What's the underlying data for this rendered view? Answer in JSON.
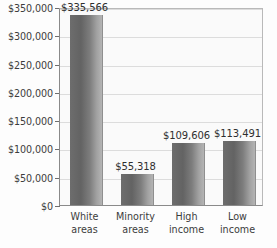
{
  "chart_data": {
    "type": "bar",
    "title": "",
    "subtitle": "",
    "xlabel": "",
    "ylabel": "",
    "categories": [
      "White areas",
      "Minority areas",
      "High income",
      "Low income"
    ],
    "category_lines": [
      [
        "White",
        "areas"
      ],
      [
        "Minority",
        "areas"
      ],
      [
        "High",
        "income"
      ],
      [
        "Low",
        "income"
      ]
    ],
    "values": [
      335566,
      55318,
      109606,
      113491
    ],
    "data_labels": [
      "$335,566",
      "$55,318",
      "$109,606",
      "$113,491"
    ],
    "ylim": [
      0,
      350000
    ],
    "ytick_values": [
      0,
      50000,
      100000,
      150000,
      200000,
      250000,
      300000,
      350000
    ],
    "ytick_labels": [
      "$0",
      "$50,000",
      "$100,000",
      "$150,000",
      "$200,000",
      "$250,000",
      "$300,000",
      "$350,000"
    ],
    "grid": true,
    "grid_axis": "y",
    "legend": false,
    "legend_position": "none",
    "bar_color_dark": "#636363",
    "bar_color_light": "#b4b4b4",
    "plot_background": "#fafafa",
    "gridline_color": "#dcdcdc",
    "axis_color": "#8a8a8a",
    "text_color": "#3c3c3c"
  }
}
